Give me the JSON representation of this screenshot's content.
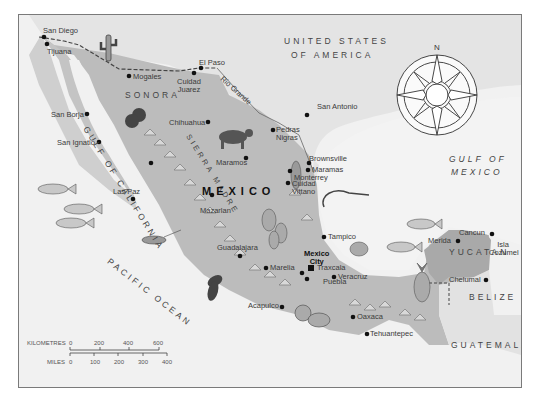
{
  "map": {
    "title": "MEXICO",
    "countries": {
      "usa_line1": "UNITED STATES",
      "usa_line2": "OF AMERICA",
      "belize": "BELIZE",
      "guatemala": "GUATEMALA"
    },
    "water": {
      "gulf_mexico_line1": "GULF OF",
      "gulf_mexico_line2": "MEXICO",
      "gulf_california": "GULF OF CALIFORNIA",
      "pacific": "PACIFIC OCEAN",
      "rio_grande": "Rio Grande"
    },
    "regions": {
      "sonora": "SONORA",
      "yucatan": "YUCATAN",
      "sierra_madre": "SIERRA MADRE"
    },
    "capital": {
      "line1": "Mexico",
      "line2": "City"
    },
    "cities": [
      {
        "name": "San Diego"
      },
      {
        "name": "Tijuana"
      },
      {
        "name": "Mogales"
      },
      {
        "name": "Cuidad Juarez"
      },
      {
        "name": "El Paso"
      },
      {
        "name": "San Borja"
      },
      {
        "name": "San Ignatio"
      },
      {
        "name": "Chihuahua"
      },
      {
        "name": "San Antonio"
      },
      {
        "name": "Pedras Nigras"
      },
      {
        "name": "Maramos"
      },
      {
        "name": "Brownsville"
      },
      {
        "name": "Maramas"
      },
      {
        "name": "Monterrey"
      },
      {
        "name": "Las Paz"
      },
      {
        "name": "Mazarlan"
      },
      {
        "name": "Cuidad Vittano"
      },
      {
        "name": "Tampico"
      },
      {
        "name": "Guadalajara"
      },
      {
        "name": "Marelia"
      },
      {
        "name": "Traxcala"
      },
      {
        "name": "Puebla"
      },
      {
        "name": "Veracruz"
      },
      {
        "name": "Acapulco"
      },
      {
        "name": "Oaxaca"
      },
      {
        "name": "Tehuantepec"
      },
      {
        "name": "Merida"
      },
      {
        "name": "Cancun"
      },
      {
        "name": "Isla Cozumel"
      },
      {
        "name": "Chelumal"
      }
    ],
    "compass": {
      "north": "N"
    },
    "scale": {
      "km_label": "KILOMETRES",
      "km_ticks": [
        "0",
        "200",
        "400",
        "600"
      ],
      "miles_label": "MILES",
      "mile_ticks": [
        "0",
        "100",
        "200",
        "300",
        "400"
      ]
    },
    "colors": {
      "sea": "#f1f1f1",
      "land_foreign": "#e2e2e2",
      "land_mexico": "#b9b9b9",
      "frame": "#7a7a7a"
    }
  }
}
